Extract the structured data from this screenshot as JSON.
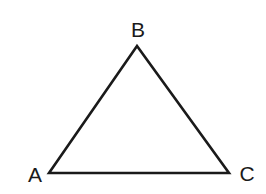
{
  "diagram": {
    "type": "triangle",
    "stroke_color": "#1a1a1a",
    "vertices": [
      {
        "label": "A",
        "x": 49,
        "y": 173
      },
      {
        "label": "B",
        "x": 137,
        "y": 46
      },
      {
        "label": "C",
        "x": 229,
        "y": 173
      }
    ],
    "labels": {
      "a": "A",
      "b": "B",
      "c": "C"
    }
  }
}
